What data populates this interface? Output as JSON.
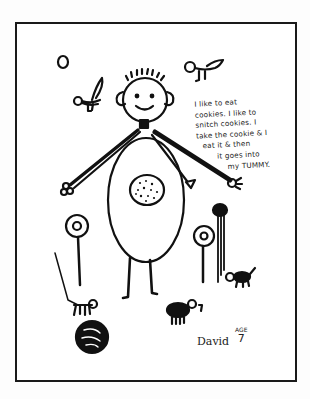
{
  "drawing": {
    "caption_lines": [
      "I like to eat",
      "cookies. I like to",
      "snitch cookies. I",
      "take the cookie & I",
      "eat it & then",
      "it goes into",
      "my TUMMY."
    ],
    "signature": "David",
    "age_label": "AGE",
    "age_value": "7",
    "ink_color": "#111111",
    "paper_color": "#ffffff"
  }
}
